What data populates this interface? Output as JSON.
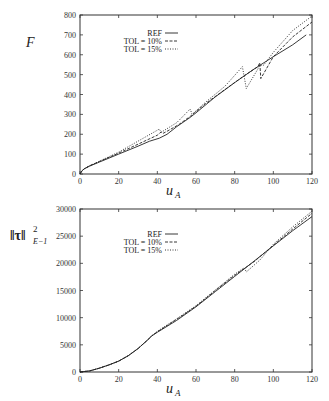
{
  "chart_data": [
    {
      "type": "line",
      "title": "",
      "xlabel": "u_A",
      "ylabel": "F",
      "xlim": [
        0,
        120
      ],
      "ylim": [
        0,
        800
      ],
      "xticks": [
        0,
        20,
        40,
        60,
        80,
        100,
        120
      ],
      "yticks": [
        0,
        100,
        200,
        300,
        400,
        500,
        600,
        700,
        800
      ],
      "grid": false,
      "legend_position": "upper-left-inside",
      "frame": {
        "x0": 80,
        "x1": 312,
        "y0": 174,
        "y1": 15
      },
      "legend": {
        "x": 162,
        "y": 33,
        "dy": 8
      },
      "series": [
        {
          "name": "REF",
          "dash": "",
          "points": [
            [
              0,
              0
            ],
            [
              1,
              15
            ],
            [
              2,
              25
            ],
            [
              5,
              40
            ],
            [
              10,
              60
            ],
            [
              20,
              100
            ],
            [
              30,
              140
            ],
            [
              36,
              165
            ],
            [
              41,
              180
            ],
            [
              45,
              200
            ],
            [
              50,
              238
            ],
            [
              57,
              285
            ],
            [
              60,
              308
            ],
            [
              70,
              388
            ],
            [
              80,
              460
            ],
            [
              90,
              528
            ],
            [
              100,
              590
            ],
            [
              110,
              650
            ],
            [
              117,
              700
            ]
          ]
        },
        {
          "name": "TOL = 10%",
          "dash": "3,1.5",
          "points": [
            [
              0,
              0
            ],
            [
              1,
              15
            ],
            [
              2,
              25
            ],
            [
              5,
              42
            ],
            [
              10,
              63
            ],
            [
              20,
              105
            ],
            [
              30,
              150
            ],
            [
              40,
              195
            ],
            [
              42,
              212
            ],
            [
              43,
              205
            ],
            [
              45,
              215
            ],
            [
              51,
              248
            ],
            [
              57,
              290
            ],
            [
              65,
              355
            ],
            [
              75,
              425
            ],
            [
              85,
              495
            ],
            [
              92,
              540
            ],
            [
              93,
              560
            ],
            [
              93.5,
              480
            ],
            [
              100,
              590
            ],
            [
              110,
              690
            ],
            [
              120,
              765
            ]
          ]
        },
        {
          "name": "TOL = 15%",
          "dash": "1,1.5",
          "points": [
            [
              0,
              0
            ],
            [
              1,
              15
            ],
            [
              2,
              25
            ],
            [
              5,
              42
            ],
            [
              10,
              64
            ],
            [
              20,
              110
            ],
            [
              30,
              165
            ],
            [
              41,
              226
            ],
            [
              42,
              210
            ],
            [
              50,
              258
            ],
            [
              57,
              327
            ],
            [
              58,
              300
            ],
            [
              65,
              362
            ],
            [
              75,
              442
            ],
            [
              84,
              540
            ],
            [
              86,
              430
            ],
            [
              93,
              545
            ],
            [
              95,
              548
            ],
            [
              100,
              612
            ],
            [
              110,
              722
            ],
            [
              120,
              795
            ]
          ]
        }
      ]
    },
    {
      "type": "line",
      "title": "",
      "xlabel": "u_A",
      "ylabel": "||τ||²_{E⁻¹}",
      "xlim": [
        0,
        120
      ],
      "ylim": [
        0,
        30000
      ],
      "xticks": [
        0,
        20,
        40,
        60,
        80,
        100,
        120
      ],
      "yticks": [
        0,
        5000,
        10000,
        15000,
        20000,
        25000,
        30000
      ],
      "grid": false,
      "legend_position": "upper-left-inside",
      "frame": {
        "x0": 80,
        "x1": 312,
        "y0": 372,
        "y1": 209
      },
      "legend": {
        "x": 162,
        "y": 234,
        "dy": 8
      },
      "series": [
        {
          "name": "REF",
          "dash": "",
          "points": [
            [
              0,
              0
            ],
            [
              5,
              200
            ],
            [
              10,
              700
            ],
            [
              15,
              1300
            ],
            [
              20,
              2000
            ],
            [
              25,
              3000
            ],
            [
              30,
              4300
            ],
            [
              35,
              5900
            ],
            [
              37,
              6600
            ],
            [
              40,
              7300
            ],
            [
              50,
              9500
            ],
            [
              60,
              12000
            ],
            [
              70,
              14800
            ],
            [
              80,
              17600
            ],
            [
              90,
              20400
            ],
            [
              100,
              23200
            ],
            [
              110,
              26000
            ],
            [
              120,
              28600
            ]
          ]
        },
        {
          "name": "TOL = 10%",
          "dash": "3,1.5",
          "points": [
            [
              0,
              0
            ],
            [
              5,
              200
            ],
            [
              10,
              700
            ],
            [
              15,
              1300
            ],
            [
              20,
              2000
            ],
            [
              25,
              3000
            ],
            [
              30,
              4300
            ],
            [
              35,
              5900
            ],
            [
              37,
              6600
            ],
            [
              40,
              7400
            ],
            [
              50,
              9700
            ],
            [
              60,
              12100
            ],
            [
              70,
              15000
            ],
            [
              80,
              17800
            ],
            [
              88,
              19800
            ],
            [
              90,
              20300
            ],
            [
              100,
              23300
            ],
            [
              110,
              26300
            ],
            [
              120,
              29200
            ]
          ]
        },
        {
          "name": "TOL = 15%",
          "dash": "1,1.5",
          "points": [
            [
              0,
              0
            ],
            [
              5,
              200
            ],
            [
              10,
              700
            ],
            [
              15,
              1300
            ],
            [
              20,
              2000
            ],
            [
              25,
              3000
            ],
            [
              30,
              4300
            ],
            [
              35,
              5900
            ],
            [
              37,
              6600
            ],
            [
              40,
              7500
            ],
            [
              50,
              9800
            ],
            [
              60,
              12200
            ],
            [
              70,
              15100
            ],
            [
              80,
              18000
            ],
            [
              85,
              19200
            ],
            [
              86,
              18400
            ],
            [
              93,
              20600
            ],
            [
              100,
              23500
            ],
            [
              110,
              26700
            ],
            [
              120,
              29600
            ]
          ]
        }
      ]
    }
  ],
  "labels": {
    "plot1_ylabel": "F",
    "plot1_xlabel_main": "u",
    "plot1_xlabel_sub": "A",
    "plot2_ylabel_main": "‖τ‖",
    "plot2_ylabel_sup": "2",
    "plot2_ylabel_sub": "E−1",
    "plot2_xlabel_main": "u",
    "plot2_xlabel_sub": "A"
  }
}
